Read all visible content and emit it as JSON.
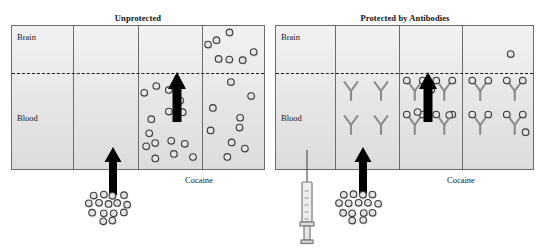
{
  "figure": {
    "width": 545,
    "height": 248,
    "background": "#ffffff",
    "panel_fill_top": "#f2f2f2",
    "panel_fill_bottom": "#dcdcdc",
    "panel_border": "#6b6b6b",
    "bbb_line_color": "#1a1a1a",
    "arrow_color": "#000000",
    "molecule_outline": "#3a3a3a",
    "molecule_fill": "#e4e4e4",
    "antibody_color": "#8a8a8a",
    "syringe_color": "#7a7a7a"
  },
  "panels": [
    {
      "id": "unprotected",
      "title": "Unprotected",
      "title_x": 138,
      "title_y": 13,
      "frame": {
        "x": 11,
        "y": 25,
        "w": 254,
        "h": 145
      },
      "dividers_x": [
        72,
        137,
        201
      ],
      "bbb_y": 72,
      "region_labels": [
        {
          "name": "brain",
          "text": "Brain",
          "x": 17,
          "y": 32
        },
        {
          "name": "blood",
          "text": "Blood",
          "x": 17,
          "y": 113
        }
      ],
      "cocaine_label": {
        "text": "Cocaine",
        "x": 185,
        "y": 175
      },
      "injection_arrow": {
        "x": 113,
        "y_tip": 147,
        "y_tail": 195,
        "shaft_w": 8,
        "head_w": 17,
        "head_h": 15
      },
      "bbb_arrow": {
        "x": 177,
        "y_tip": 72,
        "y_tail": 122,
        "shaft_w": 9,
        "head_w": 18,
        "head_h": 17
      },
      "dose_cluster": {
        "cx": 108,
        "cy": 208,
        "count": 15
      },
      "cells": [
        {
          "index": 0,
          "brain_molecules": 0,
          "blood_molecules": 0,
          "antibodies": 0
        },
        {
          "index": 1,
          "brain_molecules": 0,
          "blood_molecules": 0,
          "antibodies": 0
        },
        {
          "index": 2,
          "brain_molecules": 0,
          "blood_molecules": 15,
          "antibodies": 0
        },
        {
          "index": 3,
          "brain_molecules": 7,
          "blood_molecules": 9,
          "antibodies": 0
        }
      ]
    },
    {
      "id": "protected",
      "title": "Protected by Antibodies",
      "title_x": 405,
      "title_y": 13,
      "frame": {
        "x": 275,
        "y": 25,
        "w": 259,
        "h": 145
      },
      "dividers_x": [
        334,
        398,
        461
      ],
      "bbb_y": 72,
      "region_labels": [
        {
          "name": "brain",
          "text": "Brain",
          "x": 281,
          "y": 32
        },
        {
          "name": "blood",
          "text": "Blood",
          "x": 281,
          "y": 113
        }
      ],
      "cocaine_label": {
        "text": "Cocaine",
        "x": 447,
        "y": 175
      },
      "injection_arrow": {
        "x": 363,
        "y_tip": 147,
        "y_tail": 195,
        "shaft_w": 8,
        "head_w": 17,
        "head_h": 15
      },
      "bbb_arrow": {
        "x": 428,
        "y_tip": 72,
        "y_tail": 122,
        "shaft_w": 9,
        "head_w": 18,
        "head_h": 17
      },
      "dose_cluster": {
        "cx": 358,
        "cy": 208,
        "count": 15
      },
      "syringe": {
        "x": 307,
        "y_needle_top": 150,
        "y_bottom": 236
      },
      "cells": [
        {
          "index": 0,
          "brain_molecules": 0,
          "blood_molecules": 0,
          "antibodies": 0
        },
        {
          "index": 1,
          "brain_molecules": 0,
          "blood_molecules": 0,
          "antibodies": 4
        },
        {
          "index": 2,
          "brain_molecules": 0,
          "blood_molecules": 3,
          "antibodies": 4
        },
        {
          "index": 3,
          "brain_molecules": 1,
          "blood_molecules": 1,
          "antibodies": 4
        }
      ]
    }
  ],
  "legend_note": {
    "molecule_meaning": "Cocaine molecule",
    "antibody_meaning": "Anti-cocaine antibody",
    "dashed_line_meaning": "Blood-brain barrier"
  }
}
